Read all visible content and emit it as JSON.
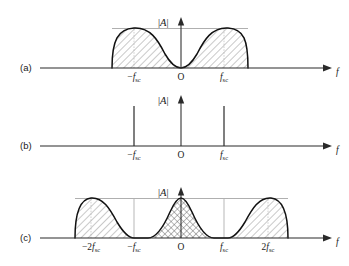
{
  "figure": {
    "type": "technical-spectrum-diagram",
    "background_color": "#ffffff",
    "curve_color": "#111111",
    "axis_color": "#2a2a2a",
    "guide_color": "#9a9a9a",
    "hatch_color": "#6f6f6f"
  },
  "axis_labels": {
    "magnitude": "|A|",
    "magnitude_bar_left": "|",
    "magnitude_symbol": "A",
    "magnitude_bar_right": "|",
    "frequency": "f"
  },
  "tick_text": {
    "origin": "O",
    "f_symbol": "f",
    "subscript": "sc",
    "minus": "−",
    "two": "2"
  },
  "panels": [
    {
      "id": "a",
      "label": "(a)",
      "baseline_y": 68,
      "plot_type": "continuous-spectrum",
      "lobes": 2,
      "center_null": true,
      "hatch_style": "single-diagonal",
      "has_cap_line": true,
      "spectrum_span_px": [
        112,
        248
      ],
      "peak_height_px": 40,
      "ticks": [
        {
          "label_parts": {
            "sign": "−",
            "sym": "f",
            "sub": "sc"
          },
          "x": 134,
          "text": "−f_sc"
        },
        {
          "label_parts": {
            "sign": "",
            "sym": "O",
            "sub": ""
          },
          "x": 181,
          "text": "O"
        },
        {
          "label_parts": {
            "sign": "",
            "sym": "f",
            "sub": "sc"
          },
          "x": 224,
          "text": "f_sc"
        }
      ]
    },
    {
      "id": "b",
      "label": "(b)",
      "baseline_y": 146,
      "plot_type": "impulse-spectrum",
      "lobes": 0,
      "center_null": false,
      "hatch_style": "none",
      "has_cap_line": false,
      "impulse_height_px": 40,
      "impulses": [
        {
          "x": 134,
          "text": "−f_sc"
        },
        {
          "x": 224,
          "text": "f_sc"
        }
      ],
      "ticks": [
        {
          "label_parts": {
            "sign": "−",
            "sym": "f",
            "sub": "sc"
          },
          "x": 134,
          "text": "−f_sc"
        },
        {
          "label_parts": {
            "sign": "",
            "sym": "O",
            "sub": ""
          },
          "x": 181,
          "text": "O"
        },
        {
          "label_parts": {
            "sign": "",
            "sym": "f",
            "sub": "sc"
          },
          "x": 224,
          "text": "f_sc"
        }
      ]
    },
    {
      "id": "c",
      "label": "(c)",
      "baseline_y": 238,
      "plot_type": "continuous-spectrum-replicated",
      "lobes": 3,
      "center_null": false,
      "hatch_style": "single-diagonal-outer-crosshatch-center",
      "has_cap_line": true,
      "spectrum_span_px": [
        75,
        288
      ],
      "peak_height_px": 40,
      "ticks": [
        {
          "label_parts": {
            "sign": "−",
            "pre": "2",
            "sym": "f",
            "sub": "sc"
          },
          "x": 91,
          "text": "−2f_sc"
        },
        {
          "label_parts": {
            "sign": "−",
            "pre": "",
            "sym": "f",
            "sub": "sc"
          },
          "x": 134,
          "text": "−f_sc"
        },
        {
          "label_parts": {
            "sign": "",
            "pre": "",
            "sym": "O",
            "sub": ""
          },
          "x": 181,
          "text": "O"
        },
        {
          "label_parts": {
            "sign": "",
            "pre": "",
            "sym": "f",
            "sub": "sc"
          },
          "x": 224,
          "text": "f_sc"
        },
        {
          "label_parts": {
            "sign": "",
            "pre": "2",
            "sym": "f",
            "sub": "sc"
          },
          "x": 268,
          "text": "2f_sc"
        }
      ]
    }
  ],
  "geometry": {
    "vertical_axis_x": 181,
    "axis_left_x": 40,
    "axis_right_x": 330,
    "freq_label_x": 338,
    "panel_label_x": 20
  }
}
